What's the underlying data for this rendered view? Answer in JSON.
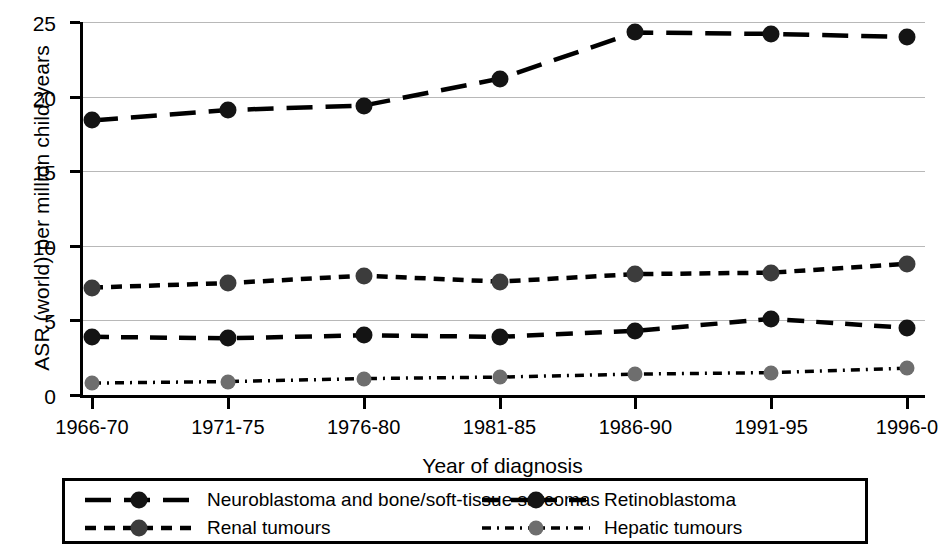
{
  "chart_data": {
    "type": "line",
    "title": "",
    "xlabel": "Year of diagnosis",
    "ylabel": "ASR (world) per million child-years",
    "categories": [
      "1966-70",
      "1971-75",
      "1976-80",
      "1981-85",
      "1986-90",
      "1991-95",
      "1996-0"
    ],
    "ylim": [
      0,
      25
    ],
    "yticks": [
      0,
      5,
      10,
      15,
      20,
      25
    ],
    "grid": true,
    "legend_position": "below",
    "series": [
      {
        "name": "Neuroblastoma and bone/soft-tissue sarcomas",
        "values": [
          18.4,
          19.1,
          19.4,
          21.2,
          24.3,
          24.2,
          24.0
        ],
        "color": "#000000",
        "dash": "long",
        "marker_color": "#141414"
      },
      {
        "name": "Renal tumours",
        "values": [
          7.2,
          7.5,
          8.0,
          7.6,
          8.1,
          8.2,
          8.8
        ],
        "color": "#000000",
        "dash": "short",
        "marker_color": "#3c3c3c"
      },
      {
        "name": "Retinoblastoma",
        "values": [
          3.9,
          3.8,
          4.0,
          3.9,
          4.3,
          5.1,
          4.5
        ],
        "color": "#000000",
        "dash": "medium",
        "marker_color": "#141414"
      },
      {
        "name": "Hepatic tumours",
        "values": [
          0.8,
          0.9,
          1.1,
          1.2,
          1.4,
          1.5,
          1.8
        ],
        "color": "#000000",
        "dash": "dashdot",
        "marker_color": "#6e6e6e"
      }
    ]
  },
  "legend": {
    "entries": [
      {
        "label": "Neuroblastoma and bone/soft-tissue sarcomas",
        "dash": "long",
        "marker_color": "#141414"
      },
      {
        "label": "Renal tumours",
        "dash": "short",
        "marker_color": "#3c3c3c"
      },
      {
        "label": "Retinoblastoma",
        "dash": "medium",
        "marker_color": "#141414"
      },
      {
        "label": "Hepatic tumours",
        "dash": "dashdot",
        "marker_color": "#6e6e6e"
      }
    ]
  },
  "axis": {
    "y_tick_labels": [
      "0",
      "5",
      "10",
      "15",
      "20",
      "25"
    ],
    "x_tick_labels": [
      "1966-70",
      "1971-75",
      "1976-80",
      "1981-85",
      "1986-90",
      "1991-95",
      "1996-0"
    ]
  }
}
